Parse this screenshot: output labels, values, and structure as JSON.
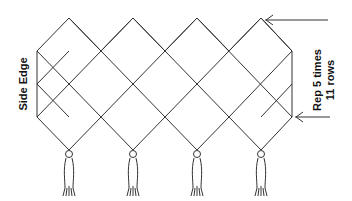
{
  "diagram": {
    "type": "knotted netting pattern",
    "side_label": "Side Edge",
    "repeat_label_line1": "Rep 5 times",
    "repeat_label_line2": "11 rows",
    "columns": 4,
    "tassel_count": 4,
    "colors": {
      "line": "#333333",
      "text": "#111111",
      "background": "#ffffff"
    }
  }
}
